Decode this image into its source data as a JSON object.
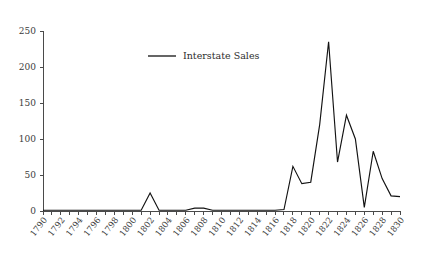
{
  "chart_data": {
    "type": "line",
    "title": "",
    "xlabel": "",
    "ylabel": "",
    "xlim": [
      1790,
      1830
    ],
    "ylim": [
      0,
      250
    ],
    "grid": false,
    "legend_position": "top-center",
    "y_ticks": [
      0,
      50,
      100,
      150,
      200,
      250
    ],
    "y_tick_labels": [
      "0",
      "50",
      "100",
      "150",
      "200",
      "250"
    ],
    "x_tick_labels": [
      "1790",
      "1792",
      "1794",
      "1796",
      "1798",
      "1800",
      "1802",
      "1804",
      "1806",
      "1808",
      "1810",
      "1812",
      "1814",
      "1816",
      "1818",
      "1820",
      "1822",
      "1824",
      "1826",
      "1828",
      "1830"
    ],
    "x_minor_tick_step": 1,
    "series": [
      {
        "name": "Interstate Sales",
        "color": "#121212",
        "x": [
          1790,
          1791,
          1792,
          1793,
          1794,
          1795,
          1796,
          1797,
          1798,
          1799,
          1800,
          1801,
          1802,
          1803,
          1804,
          1805,
          1806,
          1807,
          1808,
          1809,
          1810,
          1811,
          1812,
          1813,
          1814,
          1815,
          1816,
          1817,
          1818,
          1819,
          1820,
          1821,
          1822,
          1823,
          1824,
          1825,
          1826,
          1827,
          1828,
          1829,
          1830
        ],
        "values": [
          1,
          1,
          1,
          1,
          1,
          1,
          1,
          1,
          1,
          1,
          1,
          1,
          25,
          1,
          1,
          1,
          1,
          4,
          4,
          1,
          1,
          1,
          1,
          1,
          1,
          1,
          1,
          2,
          62,
          38,
          40,
          120,
          235,
          68,
          133,
          100,
          5,
          83,
          45,
          21,
          20
        ]
      }
    ],
    "legend": [
      {
        "label": "Interstate Sales",
        "color": "#121212"
      }
    ]
  },
  "axes_geometry": {
    "plot_left": 43,
    "plot_right": 400,
    "plot_bottom": 211,
    "plot_top": 25,
    "y_zero_px": 211,
    "y_250_px": 31
  }
}
